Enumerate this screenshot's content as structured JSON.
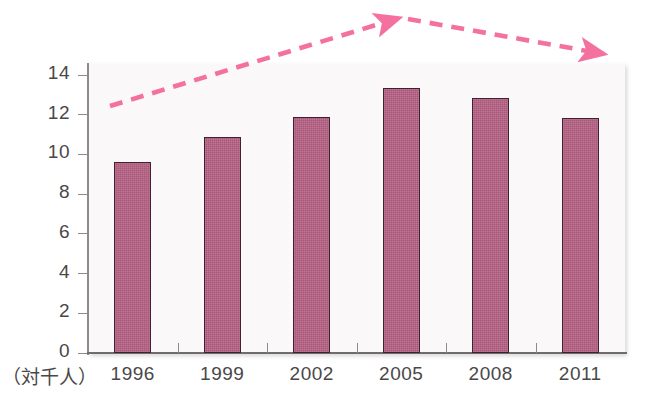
{
  "chart_data": {
    "type": "bar",
    "title": "",
    "subtitle": "",
    "xlabel": "",
    "ylabel": "",
    "unit_label": "（対千人）",
    "categories": [
      "1996",
      "1999",
      "2002",
      "2005",
      "2008",
      "2011"
    ],
    "values": [
      9.6,
      10.9,
      11.9,
      13.35,
      12.85,
      11.85
    ],
    "series": [
      {
        "name": "",
        "values": [
          9.6,
          10.9,
          11.9,
          13.35,
          12.85,
          11.85
        ]
      }
    ],
    "ylim": [
      0,
      14
    ],
    "yticks": [
      0,
      2,
      4,
      6,
      8,
      10,
      12,
      14
    ],
    "ytick_labels": [
      "0",
      "2",
      "4",
      "6",
      "8",
      "10",
      "12",
      "14"
    ],
    "grid": false,
    "legend": null,
    "bar_color": "#ab5579",
    "bar_edge_color": "#3f2230",
    "plot_background": "#fbf8f9",
    "axis_color": "#8d8a8c",
    "annotations": [
      {
        "name": "rising-trend-arrow",
        "shape": "dashed-arrow",
        "color": "#f4719f",
        "from": [
          110,
          106
        ],
        "to": [
          404,
          16
        ],
        "direction": "up-right"
      },
      {
        "name": "falling-trend-arrow",
        "shape": "dashed-arrow",
        "color": "#f4719f",
        "from": [
          406,
          18
        ],
        "to": [
          610,
          56
        ],
        "direction": "down-right"
      }
    ]
  }
}
